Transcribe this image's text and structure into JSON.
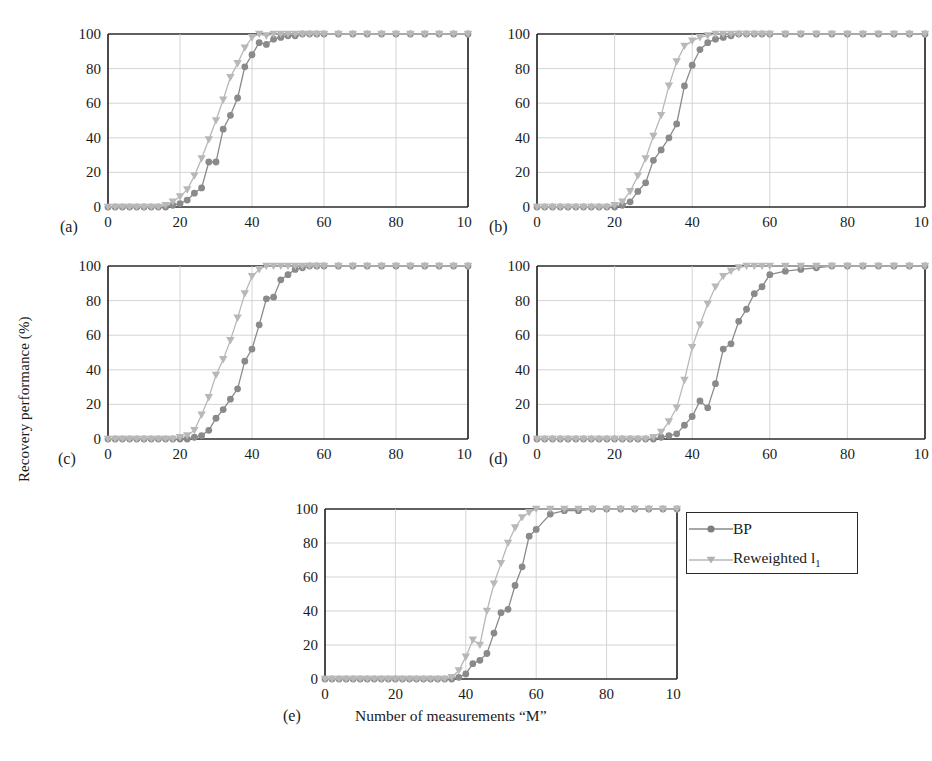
{
  "axes": {
    "ylabel": "Recovery performance (%)",
    "xlabel": "Number of measurements “M”",
    "xticks": [
      "0",
      "20",
      "40",
      "60",
      "80",
      "100"
    ],
    "yticks": [
      "0",
      "20",
      "40",
      "60",
      "80",
      "100"
    ],
    "xlim": [
      0,
      100
    ],
    "ylim": [
      0,
      100
    ]
  },
  "legend": {
    "items": [
      {
        "label": "BP",
        "marker": "circle",
        "color": "#8a8a8a"
      },
      {
        "label": "Reweighted l",
        "subscript": "1",
        "marker": "triangle-down",
        "color": "#b4b4b4"
      }
    ]
  },
  "panel_labels": {
    "a": "(a)",
    "b": "(b)",
    "c": "(c)",
    "d": "(d)",
    "e": "(e)"
  },
  "colors": {
    "bp": "#8a8a8a",
    "reweighted": "#b8b8b8",
    "axis": "#2b2b2b",
    "grid": "#cfcfcf",
    "background": "#ffffff"
  },
  "chart_data": [
    {
      "type": "line",
      "panel": "(a)",
      "title": "",
      "xlabel": "Number of measurements “M”",
      "ylabel": "Recovery performance (%)",
      "xlim": [
        0,
        100
      ],
      "ylim": [
        0,
        100
      ],
      "grid": true,
      "x": [
        0,
        2,
        4,
        6,
        8,
        10,
        12,
        14,
        16,
        18,
        20,
        22,
        24,
        26,
        28,
        30,
        32,
        34,
        36,
        38,
        40,
        42,
        44,
        46,
        48,
        50,
        52,
        54,
        56,
        58,
        60,
        64,
        68,
        72,
        76,
        80,
        84,
        88,
        92,
        96,
        100
      ],
      "series": [
        {
          "name": "BP",
          "values": [
            0,
            0,
            0,
            0,
            0,
            0,
            0,
            0,
            0,
            1,
            2,
            4,
            8,
            11,
            26,
            26,
            45,
            53,
            63,
            81,
            88,
            95,
            94,
            97,
            98,
            99,
            99,
            100,
            100,
            100,
            100,
            100,
            100,
            100,
            100,
            100,
            100,
            100,
            100,
            100,
            100
          ]
        },
        {
          "name": "Reweighted l1",
          "values": [
            0,
            0,
            0,
            0,
            0,
            0,
            0,
            0,
            1,
            3,
            6,
            10,
            18,
            28,
            39,
            50,
            62,
            75,
            83,
            92,
            98,
            100,
            99,
            100,
            100,
            100,
            100,
            100,
            100,
            100,
            100,
            100,
            100,
            100,
            100,
            100,
            100,
            100,
            100,
            100,
            100
          ]
        }
      ]
    },
    {
      "type": "line",
      "panel": "(b)",
      "title": "",
      "xlabel": "Number of measurements “M”",
      "ylabel": "Recovery performance (%)",
      "xlim": [
        0,
        100
      ],
      "ylim": [
        0,
        100
      ],
      "grid": true,
      "x": [
        0,
        2,
        4,
        6,
        8,
        10,
        12,
        14,
        16,
        18,
        20,
        22,
        24,
        26,
        28,
        30,
        32,
        34,
        36,
        38,
        40,
        42,
        44,
        46,
        48,
        50,
        52,
        54,
        56,
        58,
        60,
        64,
        68,
        72,
        76,
        80,
        84,
        88,
        92,
        96,
        100
      ],
      "series": [
        {
          "name": "BP",
          "values": [
            0,
            0,
            0,
            0,
            0,
            0,
            0,
            0,
            0,
            0,
            0,
            1,
            3,
            9,
            14,
            27,
            33,
            40,
            48,
            70,
            82,
            91,
            95,
            97,
            98,
            99,
            100,
            100,
            100,
            100,
            100,
            100,
            100,
            100,
            100,
            100,
            100,
            100,
            100,
            100,
            100
          ]
        },
        {
          "name": "Reweighted l1",
          "values": [
            0,
            0,
            0,
            0,
            0,
            0,
            0,
            0,
            0,
            0,
            1,
            3,
            9,
            18,
            28,
            41,
            53,
            70,
            84,
            93,
            96,
            98,
            99,
            100,
            100,
            100,
            100,
            100,
            100,
            100,
            100,
            100,
            100,
            100,
            100,
            100,
            100,
            100,
            100,
            100,
            100
          ]
        }
      ]
    },
    {
      "type": "line",
      "panel": "(c)",
      "title": "",
      "xlabel": "Number of measurements “M”",
      "ylabel": "Recovery performance (%)",
      "xlim": [
        0,
        100
      ],
      "ylim": [
        0,
        100
      ],
      "grid": true,
      "x": [
        0,
        2,
        4,
        6,
        8,
        10,
        12,
        14,
        16,
        18,
        20,
        22,
        24,
        26,
        28,
        30,
        32,
        34,
        36,
        38,
        40,
        42,
        44,
        46,
        48,
        50,
        52,
        54,
        56,
        58,
        60,
        64,
        68,
        72,
        76,
        80,
        84,
        88,
        92,
        96,
        100
      ],
      "series": [
        {
          "name": "BP",
          "values": [
            0,
            0,
            0,
            0,
            0,
            0,
            0,
            0,
            0,
            0,
            0,
            0,
            1,
            2,
            5,
            12,
            17,
            23,
            29,
            45,
            52,
            66,
            81,
            82,
            92,
            95,
            98,
            99,
            100,
            100,
            100,
            100,
            100,
            100,
            100,
            100,
            100,
            100,
            100,
            100,
            100
          ]
        },
        {
          "name": "Reweighted l1",
          "values": [
            0,
            0,
            0,
            0,
            0,
            0,
            0,
            0,
            0,
            0,
            1,
            2,
            5,
            14,
            24,
            37,
            46,
            57,
            70,
            84,
            94,
            98,
            100,
            100,
            100,
            100,
            100,
            100,
            100,
            100,
            100,
            100,
            100,
            100,
            100,
            100,
            100,
            100,
            100,
            100,
            100
          ]
        }
      ]
    },
    {
      "type": "line",
      "panel": "(d)",
      "title": "",
      "xlabel": "Number of measurements “M”",
      "ylabel": "Recovery performance (%)",
      "xlim": [
        0,
        100
      ],
      "ylim": [
        0,
        100
      ],
      "grid": true,
      "x": [
        0,
        2,
        4,
        6,
        8,
        10,
        12,
        14,
        16,
        18,
        20,
        22,
        24,
        26,
        28,
        30,
        32,
        34,
        36,
        38,
        40,
        42,
        44,
        46,
        48,
        50,
        52,
        54,
        56,
        58,
        60,
        64,
        68,
        72,
        76,
        80,
        84,
        88,
        92,
        96,
        100
      ],
      "series": [
        {
          "name": "BP",
          "values": [
            0,
            0,
            0,
            0,
            0,
            0,
            0,
            0,
            0,
            0,
            0,
            0,
            0,
            0,
            0,
            0,
            1,
            2,
            3,
            8,
            13,
            22,
            18,
            32,
            52,
            55,
            68,
            75,
            84,
            88,
            95,
            97,
            98,
            99,
            100,
            100,
            100,
            100,
            100,
            100,
            100
          ]
        },
        {
          "name": "Reweighted l1",
          "values": [
            0,
            0,
            0,
            0,
            0,
            0,
            0,
            0,
            0,
            0,
            0,
            0,
            0,
            0,
            0,
            1,
            4,
            10,
            18,
            34,
            53,
            66,
            78,
            88,
            94,
            97,
            99,
            100,
            100,
            100,
            100,
            100,
            100,
            100,
            100,
            100,
            100,
            100,
            100,
            100,
            100
          ]
        }
      ]
    },
    {
      "type": "line",
      "panel": "(e)",
      "title": "",
      "xlabel": "Number of measurements “M”",
      "ylabel": "Recovery performance (%)",
      "xlim": [
        0,
        100
      ],
      "ylim": [
        0,
        100
      ],
      "grid": true,
      "x": [
        0,
        2,
        4,
        6,
        8,
        10,
        12,
        14,
        16,
        18,
        20,
        22,
        24,
        26,
        28,
        30,
        32,
        34,
        36,
        38,
        40,
        42,
        44,
        46,
        48,
        50,
        52,
        54,
        56,
        58,
        60,
        64,
        68,
        72,
        76,
        80,
        84,
        88,
        92,
        96,
        100
      ],
      "series": [
        {
          "name": "BP",
          "values": [
            0,
            0,
            0,
            0,
            0,
            0,
            0,
            0,
            0,
            0,
            0,
            0,
            0,
            0,
            0,
            0,
            0,
            0,
            0,
            1,
            3,
            9,
            11,
            15,
            27,
            39,
            41,
            55,
            66,
            84,
            88,
            97,
            99,
            99,
            100,
            100,
            100,
            100,
            100,
            100,
            100
          ]
        },
        {
          "name": "Reweighted l1",
          "values": [
            0,
            0,
            0,
            0,
            0,
            0,
            0,
            0,
            0,
            0,
            0,
            0,
            0,
            0,
            0,
            0,
            0,
            0,
            1,
            5,
            13,
            23,
            20,
            40,
            56,
            68,
            80,
            89,
            95,
            98,
            100,
            100,
            100,
            100,
            100,
            100,
            100,
            100,
            100,
            100,
            100
          ]
        }
      ]
    }
  ]
}
